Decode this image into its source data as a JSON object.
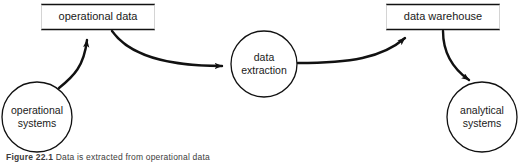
{
  "figure": {
    "caption_number": "Figure 22.1",
    "caption_text": "Data is extracted from operational data",
    "background_color": "#ffffff",
    "line_color": "#1a1a1a",
    "text_color": "#1a1a1a"
  },
  "diagram": {
    "type": "data-flow-diagram",
    "data_stores": [
      {
        "id": "operational-data",
        "label": "operational data",
        "shape": "open-ended-box"
      },
      {
        "id": "data-warehouse",
        "label": "data warehouse",
        "shape": "open-ended-box"
      }
    ],
    "processes": [
      {
        "id": "operational-systems",
        "label_line1": "operational",
        "label_line2": "systems",
        "shape": "circle"
      },
      {
        "id": "data-extraction",
        "label_line1": "data",
        "label_line2": "extraction",
        "shape": "circle"
      },
      {
        "id": "analytical-systems",
        "label_line1": "analytical",
        "label_line2": "systems",
        "shape": "circle"
      }
    ],
    "flows": [
      {
        "id": "flow-opsys-to-opdata",
        "from": "operational-systems",
        "to": "operational-data"
      },
      {
        "id": "flow-opdata-to-extraction",
        "from": "operational-data",
        "to": "data-extraction"
      },
      {
        "id": "flow-extraction-to-warehouse",
        "from": "data-extraction",
        "to": "data-warehouse"
      },
      {
        "id": "flow-warehouse-to-analytical",
        "from": "data-warehouse",
        "to": "analytical-systems"
      }
    ]
  }
}
